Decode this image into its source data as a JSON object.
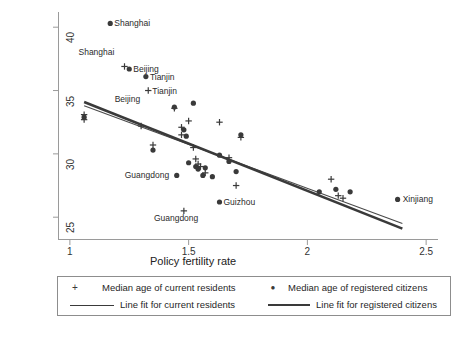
{
  "chart_data": {
    "type": "scatter",
    "title": "",
    "xlabel": "Policy fertility rate",
    "ylabel": "Median age of population in 2000",
    "xlim": [
      0.95,
      2.55
    ],
    "ylim": [
      23.2,
      41.2
    ],
    "xticks": [
      1,
      1.5,
      2,
      2.5
    ],
    "xtick_labels": [
      "1",
      "1.5",
      "2",
      "2.5"
    ],
    "yticks": [
      25,
      30,
      35,
      40
    ],
    "ytick_labels": [
      "25",
      "30",
      "35",
      "40"
    ],
    "grid": false,
    "legend_position": "below-plot",
    "series": [
      {
        "name": "Median age of current residents",
        "marker": "plus",
        "color": "#3a3a3a",
        "points": [
          {
            "x": 1.06,
            "y": 33.1
          },
          {
            "x": 1.06,
            "y": 32.7
          },
          {
            "x": 1.23,
            "y": 36.9
          },
          {
            "x": 1.3,
            "y": 32.2
          },
          {
            "x": 1.33,
            "y": 35.0
          },
          {
            "x": 1.35,
            "y": 30.7
          },
          {
            "x": 1.44,
            "y": 33.6
          },
          {
            "x": 1.47,
            "y": 32.1
          },
          {
            "x": 1.47,
            "y": 31.5
          },
          {
            "x": 1.5,
            "y": 32.6
          },
          {
            "x": 1.52,
            "y": 30.5
          },
          {
            "x": 1.53,
            "y": 29.6
          },
          {
            "x": 1.54,
            "y": 29.2
          },
          {
            "x": 1.55,
            "y": 29.0
          },
          {
            "x": 1.57,
            "y": 28.5
          },
          {
            "x": 1.63,
            "y": 32.5
          },
          {
            "x": 1.67,
            "y": 29.7
          },
          {
            "x": 1.7,
            "y": 27.5
          },
          {
            "x": 1.72,
            "y": 31.3
          },
          {
            "x": 1.48,
            "y": 25.5
          },
          {
            "x": 2.1,
            "y": 28.0
          },
          {
            "x": 2.13,
            "y": 26.7
          },
          {
            "x": 2.15,
            "y": 26.5
          }
        ]
      },
      {
        "name": "Median age of registered citizens",
        "marker": "dot",
        "color": "#3a3a3a",
        "points": [
          {
            "x": 1.17,
            "y": 40.3
          },
          {
            "x": 1.06,
            "y": 32.9
          },
          {
            "x": 1.25,
            "y": 36.7
          },
          {
            "x": 1.32,
            "y": 36.1
          },
          {
            "x": 1.35,
            "y": 30.3
          },
          {
            "x": 1.44,
            "y": 33.7
          },
          {
            "x": 1.48,
            "y": 31.9
          },
          {
            "x": 1.49,
            "y": 31.4
          },
          {
            "x": 1.52,
            "y": 34.0
          },
          {
            "x": 1.5,
            "y": 29.3
          },
          {
            "x": 1.53,
            "y": 29.0
          },
          {
            "x": 1.54,
            "y": 28.8
          },
          {
            "x": 1.56,
            "y": 28.3
          },
          {
            "x": 1.57,
            "y": 28.9
          },
          {
            "x": 1.6,
            "y": 28.2
          },
          {
            "x": 1.63,
            "y": 29.9
          },
          {
            "x": 1.67,
            "y": 29.4
          },
          {
            "x": 1.7,
            "y": 28.6
          },
          {
            "x": 1.72,
            "y": 31.5
          },
          {
            "x": 1.45,
            "y": 28.3
          },
          {
            "x": 1.63,
            "y": 26.2
          },
          {
            "x": 2.05,
            "y": 27.0
          },
          {
            "x": 2.12,
            "y": 27.2
          },
          {
            "x": 2.18,
            "y": 27.0
          },
          {
            "x": 2.38,
            "y": 26.4
          }
        ]
      }
    ],
    "fit_lines": [
      {
        "name": "Line fit for current residents",
        "style": "thin",
        "color": "#4a4a4a",
        "x0": 1.06,
        "y0": 33.8,
        "x1": 2.4,
        "y1": 24.5
      },
      {
        "name": "Line fit for registered citizens",
        "style": "thick",
        "color": "#3a3a3a",
        "x0": 1.06,
        "y0": 34.1,
        "x1": 2.4,
        "y1": 24.1
      }
    ],
    "annotations": [
      {
        "text": "Shanghai",
        "x": 1.17,
        "y": 40.3,
        "anchor": "right-of-point",
        "dx": 4,
        "dy": 0
      },
      {
        "text": "Shanghai",
        "x": 1.23,
        "y": 36.9,
        "anchor": "left-above",
        "dx": -46,
        "dy": -14
      },
      {
        "text": "Beijing",
        "x": 1.25,
        "y": 36.7,
        "anchor": "right-of-point",
        "dx": 4,
        "dy": 0
      },
      {
        "text": "Tianjin",
        "x": 1.32,
        "y": 36.1,
        "anchor": "right-of-point",
        "dx": 4,
        "dy": 0
      },
      {
        "text": "Tianjin",
        "x": 1.33,
        "y": 35.0,
        "anchor": "right-of-point",
        "dx": 4,
        "dy": 0
      },
      {
        "text": "Beijing",
        "x": 1.18,
        "y": 34.3,
        "anchor": "right-of-point",
        "dx": 2,
        "dy": 0
      },
      {
        "text": "Guangdong",
        "x": 1.45,
        "y": 28.3,
        "anchor": "left-of-point",
        "dx": -52,
        "dy": 0
      },
      {
        "text": "Guangdong",
        "x": 1.48,
        "y": 25.5,
        "anchor": "below-left",
        "dx": -30,
        "dy": 7
      },
      {
        "text": "Guizhou",
        "x": 1.63,
        "y": 26.2,
        "anchor": "right-of-point",
        "dx": 4,
        "dy": 0
      },
      {
        "text": "Xinjiang",
        "x": 2.38,
        "y": 26.4,
        "anchor": "right-of-point",
        "dx": 5,
        "dy": 0
      }
    ]
  },
  "axes": {
    "x_title": "Policy fertility rate",
    "y_title": "Median age of population in 2000",
    "x_tick_labels": [
      "1",
      "1.5",
      "2",
      "2.5"
    ],
    "y_tick_labels": [
      "25",
      "30",
      "35",
      "40"
    ]
  },
  "legend": {
    "entries": [
      {
        "label": "Median age of current residents",
        "symbol": "+",
        "kind": "marker"
      },
      {
        "label": "Median age of registered citizens",
        "symbol": "●",
        "kind": "marker"
      },
      {
        "label": "Line fit for current residents",
        "symbol": "",
        "kind": "line-thin"
      },
      {
        "label": "Line fit for registered citizens",
        "symbol": "",
        "kind": "line-thick"
      }
    ]
  },
  "colors": {
    "marker": "#3a3a3a",
    "axis": "#9a9a9a",
    "text": "#222222",
    "background": "#ffffff"
  }
}
